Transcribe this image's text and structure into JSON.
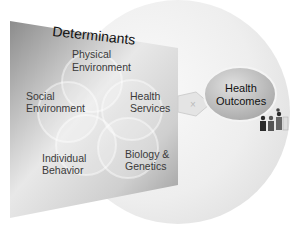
{
  "diagram": {
    "title": "Determinants",
    "determinants": [
      {
        "id": "physical",
        "line1": "Physical",
        "line2": "Environment"
      },
      {
        "id": "social",
        "line1": "Social",
        "line2": "Environment"
      },
      {
        "id": "health-services",
        "line1": "Health",
        "line2": "Services"
      },
      {
        "id": "individual",
        "line1": "Individual",
        "line2": "Behavior"
      },
      {
        "id": "biology",
        "line1": "Biology &",
        "line2": "Genetics"
      }
    ],
    "outcome": {
      "line1": "Health",
      "line2": "Outcomes"
    },
    "icons": [
      "arrow-icon",
      "people-icon"
    ],
    "colors": {
      "panel_dark": "#8a8a8a",
      "panel_light": "#e6e6e6",
      "background_disc": "#f0f0f0",
      "outcome_ellipse": "#b5b5b5"
    }
  }
}
